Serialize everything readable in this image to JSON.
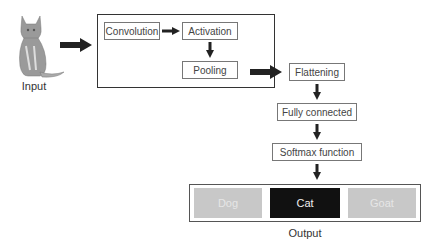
{
  "input": {
    "label": "Input",
    "image": "cat-photo"
  },
  "feature_block": {
    "nodes": [
      {
        "id": "convolution",
        "label": "Convolution"
      },
      {
        "id": "activation",
        "label": "Activation"
      },
      {
        "id": "pooling",
        "label": "Pooling"
      }
    ]
  },
  "pipeline": [
    {
      "id": "flattening",
      "label": "Flattening"
    },
    {
      "id": "fully_connected",
      "label": "Fully connected"
    },
    {
      "id": "softmax",
      "label": "Softmax function"
    }
  ],
  "output": {
    "label": "Output",
    "classes": [
      {
        "label": "Dog",
        "selected": false,
        "color": "#c8c8c8"
      },
      {
        "label": "Cat",
        "selected": true,
        "color": "#111111"
      },
      {
        "label": "Goat",
        "selected": false,
        "color": "#c8c8c8"
      }
    ]
  },
  "edges": [
    [
      "input",
      "feature_block"
    ],
    [
      "convolution",
      "activation"
    ],
    [
      "activation",
      "pooling"
    ],
    [
      "feature_block",
      "flattening"
    ],
    [
      "flattening",
      "fully_connected"
    ],
    [
      "fully_connected",
      "softmax"
    ],
    [
      "softmax",
      "output"
    ]
  ]
}
